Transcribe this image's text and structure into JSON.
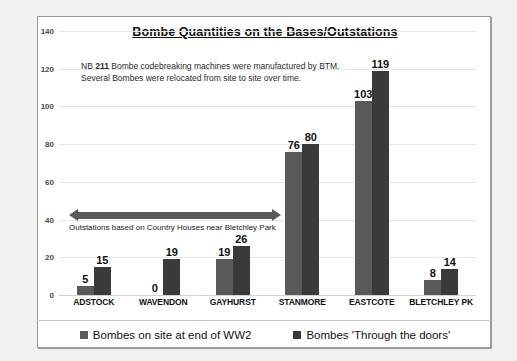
{
  "chart_data": {
    "type": "bar",
    "title": "Bombe Quantities on the Bases/Outstations",
    "xlabel": "",
    "ylabel": "",
    "ylim": [
      0,
      140
    ],
    "yticks": [
      0,
      20,
      40,
      60,
      80,
      100,
      120,
      140
    ],
    "grid": true,
    "legend_position": "bottom",
    "categories": [
      "ADSTOCK",
      "WAVENDON",
      "GAYHURST",
      "STANMORE",
      "EASTCOTE",
      "BLETCHLEY PK"
    ],
    "series": [
      {
        "name": "Bombes on site at end of WW2",
        "color": "#595959",
        "values": [
          5,
          0,
          19,
          76,
          103,
          8
        ]
      },
      {
        "name": "Bombes 'Through the doors'",
        "color": "#3a3a3a",
        "values": [
          15,
          19,
          26,
          80,
          119,
          14
        ]
      }
    ],
    "annotations": [
      {
        "name": "note",
        "line1_prefix": "NB ",
        "line1_bold": "211",
        "line1_suffix": " Bombe codebreaking machines were manufactured by BTM.",
        "line2": "Several Bombes were relocated from site to site over time."
      },
      {
        "name": "outstations-arrow",
        "caption": "Outstations based on Country Houses near Bletchley Park"
      }
    ]
  }
}
